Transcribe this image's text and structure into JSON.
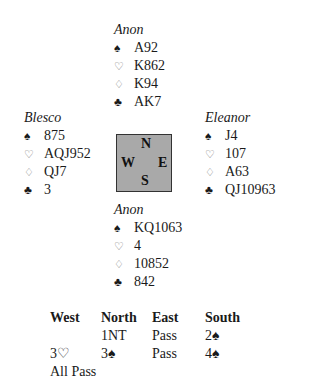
{
  "hands": {
    "north": {
      "player": "Anon",
      "spades": "A92",
      "hearts": "K862",
      "diamonds": "K94",
      "clubs": "AK7"
    },
    "west": {
      "player": "Blesco",
      "spades": "875",
      "hearts": "AQJ952",
      "diamonds": "QJ7",
      "clubs": "3"
    },
    "east": {
      "player": "Eleanor",
      "spades": "J4",
      "hearts": "107",
      "diamonds": "A63",
      "clubs": "QJ10963"
    },
    "south": {
      "player": "Anon",
      "spades": "KQ1063",
      "hearts": "4",
      "diamonds": "10852",
      "clubs": "842"
    }
  },
  "suits": {
    "spades": "♠",
    "hearts": "♡",
    "diamonds": "♢",
    "clubs": "♣"
  },
  "compass": {
    "n": "N",
    "s": "S",
    "w": "W",
    "e": "E"
  },
  "auction": {
    "headers": [
      "West",
      "North",
      "East",
      "South"
    ],
    "rows": [
      [
        "",
        "1NT",
        "Pass",
        "2♠"
      ],
      [
        "3♡",
        "3♠",
        "Pass",
        "4♠"
      ],
      [
        "All Pass",
        "",
        "",
        ""
      ]
    ]
  }
}
